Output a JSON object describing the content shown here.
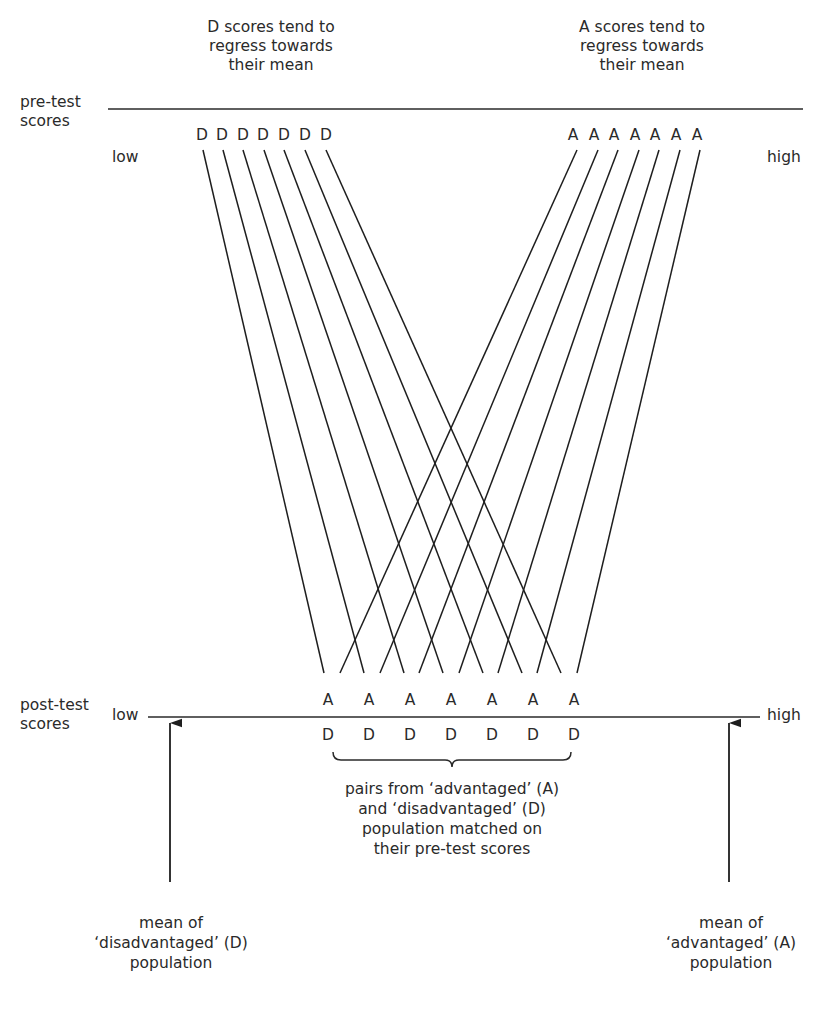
{
  "annotations": {
    "d_regress": [
      "D scores tend to",
      "regress towards",
      "their mean"
    ],
    "a_regress": [
      "A scores tend to",
      "regress towards",
      "their mean"
    ],
    "pairs_note": [
      "pairs from ‘advantaged’ (A)",
      "and ‘disadvantaged’ (D)",
      "population matched on",
      "their pre-test scores"
    ],
    "mean_d": [
      "mean of",
      "‘disadvantaged’ (D)",
      "population"
    ],
    "mean_a": [
      "mean of",
      "‘advantaged’ (A)",
      "population"
    ]
  },
  "pre_test": {
    "label": [
      "pre-test",
      "scores"
    ],
    "low": "low",
    "high": "high",
    "d_letters": [
      "D",
      "D",
      "D",
      "D",
      "D",
      "D",
      "D"
    ],
    "a_letters": [
      "A",
      "A",
      "A",
      "A",
      "A",
      "A",
      "A"
    ]
  },
  "post_test": {
    "label": [
      "post-test",
      "scores"
    ],
    "low": "low",
    "high": "high",
    "a_letters": [
      "A",
      "A",
      "A",
      "A",
      "A",
      "A",
      "A"
    ],
    "d_letters": [
      "D",
      "D",
      "D",
      "D",
      "D",
      "D",
      "D"
    ]
  },
  "colors": {
    "ink": "#2a2a2a",
    "background": "#ffffff"
  }
}
